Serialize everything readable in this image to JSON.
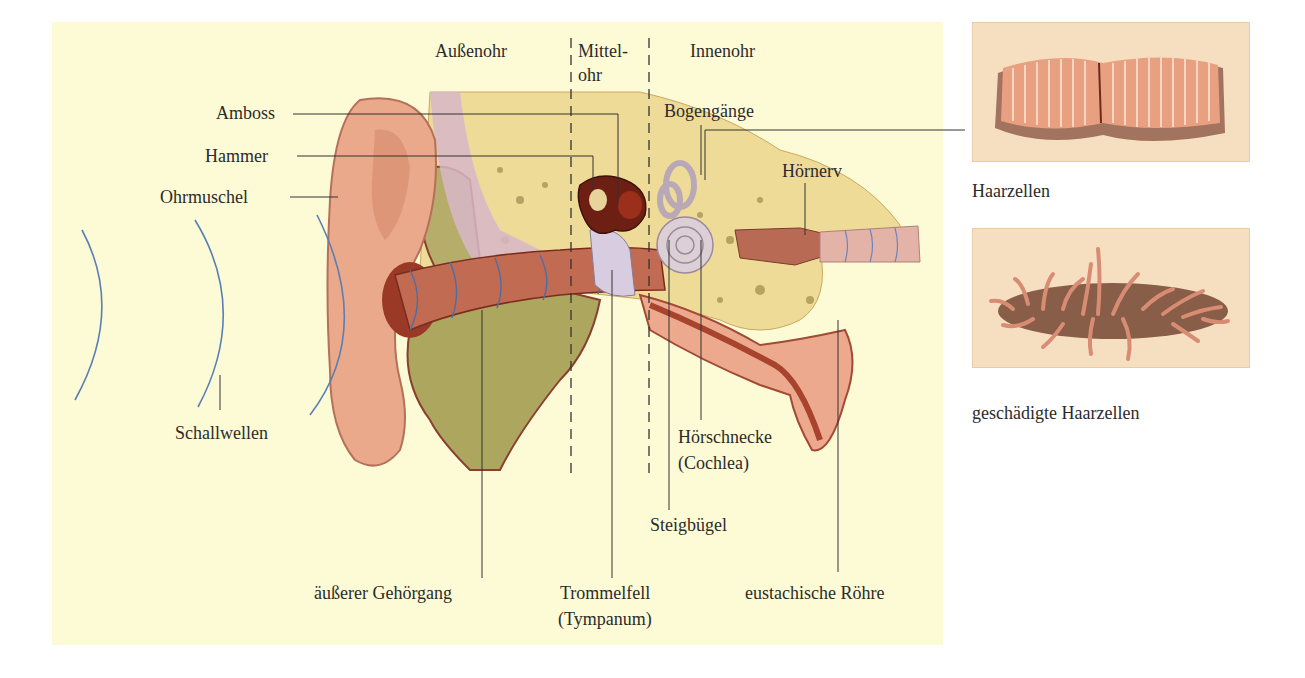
{
  "diagram": {
    "title_regions": {
      "outer_ear": "Außenohr",
      "middle_ear_line1": "Mittel-",
      "middle_ear_line2": "ohr",
      "inner_ear": "Innenohr"
    },
    "labels": {
      "anvil": "Amboss",
      "hammer": "Hammer",
      "auricle": "Ohrmuschel",
      "sound_waves": "Schallwellen",
      "ear_canal": "äußerer Gehörgang",
      "eardrum_line1": "Trommelfell",
      "eardrum_line2": "(Tympanum)",
      "stirrup": "Steigbügel",
      "semicircular_canals": "Bogengänge",
      "cochlea_line1": "Hörschnecke",
      "cochlea_line2": "(Cochlea)",
      "auditory_nerve": "Hörnerv",
      "eustachian_tube": "eustachische Röhre"
    },
    "insets": [
      {
        "caption": "Haarzellen"
      },
      {
        "caption": "geschädigte Haarzellen"
      }
    ],
    "colors": {
      "panel_background": "#fdfbd6",
      "skin": "#e9a886",
      "canal": "#b8543a",
      "bone": "#e8d48a",
      "fat_tissue": "#a9a35a",
      "membrane": "#d9c9e0",
      "sound_wave": "#5a7fb5",
      "leader_line": "#333333"
    }
  }
}
